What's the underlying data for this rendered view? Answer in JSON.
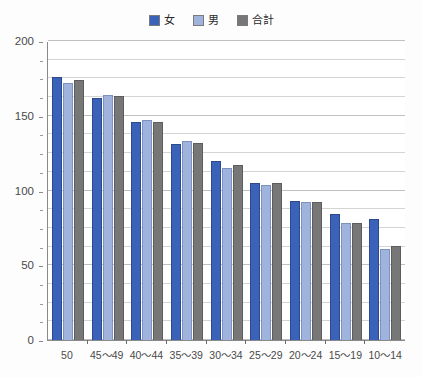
{
  "chart_data": {
    "type": "bar",
    "title": "",
    "subtitle": "",
    "xlabel": "",
    "ylabel": "",
    "ylim": [
      0,
      200
    ],
    "yticks": [
      0,
      50,
      100,
      150,
      200
    ],
    "ytick_labels": [
      "0",
      "50",
      "100",
      "150",
      "200"
    ],
    "grid": true,
    "grid_minor_step": 12.5,
    "legend_position": "top-center",
    "categories": [
      "50",
      "45〜49",
      "40〜44",
      "35〜39",
      "30〜34",
      "25〜29",
      "20〜24",
      "15〜19",
      "10〜14"
    ],
    "series": [
      {
        "name": "女",
        "color": "#3a62b8",
        "values": [
          176,
          162,
          146,
          131,
          120,
          105,
          93,
          84,
          81
        ]
      },
      {
        "name": "男",
        "color": "#9fb3dd",
        "values": [
          172,
          164,
          147,
          133,
          115,
          104,
          92,
          78,
          61
        ]
      },
      {
        "name": "合計",
        "color": "#777777",
        "values": [
          174,
          163,
          146,
          132,
          117,
          105,
          92,
          78,
          63
        ]
      }
    ]
  },
  "legend": {
    "items": [
      {
        "label": "女",
        "color": "#3a62b8"
      },
      {
        "label": "男",
        "color": "#9fb3dd"
      },
      {
        "label": "合計",
        "color": "#777777"
      }
    ]
  }
}
